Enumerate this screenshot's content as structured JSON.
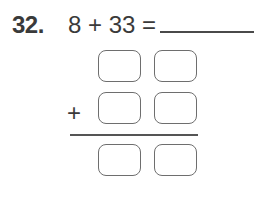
{
  "problem": {
    "number": "32.",
    "equation": "8 + 33 =",
    "operator": "+",
    "answer_blank": "",
    "addend_rows": [
      {
        "tens": "",
        "ones": ""
      },
      {
        "tens": "",
        "ones": ""
      }
    ],
    "sum_row": {
      "tens": "",
      "ones": ""
    }
  }
}
